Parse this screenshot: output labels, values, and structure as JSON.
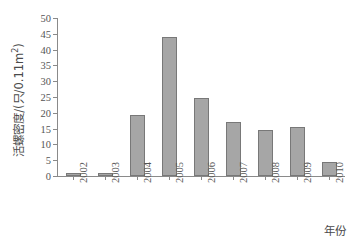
{
  "chart_data": {
    "type": "bar",
    "title": "",
    "xlabel": "年份",
    "ylabel": "活螺密度/(只/0.11m²)",
    "ylabel_parts": {
      "prefix": "活螺密度/(只/0.11m",
      "superscript": "2",
      "suffix": ")"
    },
    "categories": [
      "2002",
      "2003",
      "2004",
      "2005",
      "2006",
      "2007",
      "2008",
      "2009",
      "2010"
    ],
    "values": [
      0.8,
      0.8,
      19.4,
      43.9,
      24.7,
      17.0,
      14.6,
      15.6,
      4.5
    ],
    "ylim": [
      0,
      50
    ],
    "ytick_values": [
      0,
      5,
      10,
      15,
      20,
      25,
      30,
      35,
      40,
      45,
      50
    ],
    "ytick_labels": [
      "0",
      "5",
      "10",
      "15",
      "20",
      "25",
      "30",
      "35",
      "40",
      "45",
      "50"
    ],
    "grid": false,
    "legend": null,
    "bar_color": "#a6a6a6",
    "bar_edge_color": "#787878",
    "axis_color": "#8a8a8a",
    "background_color": "#ffffff"
  }
}
